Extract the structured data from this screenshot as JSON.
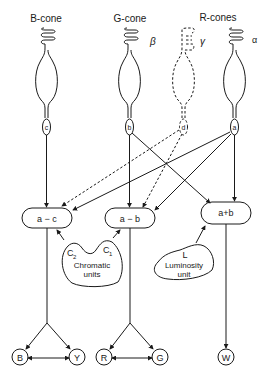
{
  "cones": [
    {
      "id": "b-cone",
      "label": "B-cone",
      "greek": "",
      "bulb": "c"
    },
    {
      "id": "g-cone",
      "label": "G-cone",
      "greek": "β",
      "bulb": "b"
    },
    {
      "id": "r-cone-gamma",
      "label": "",
      "greek": "γ",
      "bulb": "d"
    },
    {
      "id": "r-cone-alpha",
      "label": "",
      "greek": "α",
      "bulb": "a"
    }
  ],
  "group_label_r": "R-cones",
  "units": [
    {
      "id": "a-c",
      "label": "a − c"
    },
    {
      "id": "a-b",
      "label": "a − b"
    },
    {
      "id": "a+b",
      "label": "a+b"
    }
  ],
  "blobs": {
    "chromatic": {
      "label1": "Chromatic",
      "label2": "units",
      "c2": "C",
      "c2sub": "2",
      "c1": "C",
      "c1sub": "1"
    },
    "luminosity": {
      "letter": "L",
      "label1": "Luminosity",
      "label2": "unit"
    }
  },
  "outputs": [
    {
      "id": "B",
      "label": "B"
    },
    {
      "id": "Y",
      "label": "Y"
    },
    {
      "id": "R",
      "label": "R"
    },
    {
      "id": "G",
      "label": "G"
    },
    {
      "id": "W",
      "label": "W"
    }
  ]
}
